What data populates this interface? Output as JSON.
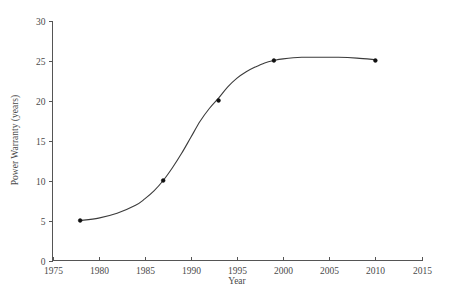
{
  "chart_data": {
    "type": "line",
    "title": "",
    "xlabel": "Year",
    "ylabel": "Power Warranty (years)",
    "xlim": [
      1975,
      2015
    ],
    "ylim": [
      0,
      30
    ],
    "xticks": [
      1975,
      1980,
      1985,
      1990,
      1995,
      2000,
      2005,
      2010,
      2015
    ],
    "xtick_labels": [
      "1975",
      "1980",
      "1985",
      "1990",
      "1995",
      "2000",
      "2005",
      "2010",
      "2015"
    ],
    "yticks": [
      0,
      5,
      10,
      15,
      20,
      25,
      30
    ],
    "ytick_labels": [
      "0",
      "5",
      "10",
      "15",
      "20",
      "25",
      "30"
    ],
    "grid": false,
    "legend": false,
    "marker": "dot",
    "line_color": "#3b3b3b",
    "marker_color": "#111111",
    "axis_color": "#555555",
    "background": "#ffffff",
    "series": [
      {
        "name": "Power Warranty",
        "x": [
          1978,
          1987,
          1993,
          1999,
          2010
        ],
        "values": [
          5,
          10,
          20,
          25,
          25
        ]
      }
    ],
    "fit_curve": {
      "shape": "sigmoid",
      "description": "smooth S-curve rising from about 5 years in 1978 to a plateau near 25 years after 2000",
      "points": [
        [
          1978,
          5.0
        ],
        [
          1980,
          5.3
        ],
        [
          1982,
          5.9
        ],
        [
          1984,
          6.9
        ],
        [
          1985,
          7.7
        ],
        [
          1986,
          8.7
        ],
        [
          1987,
          10.0
        ],
        [
          1988,
          11.6
        ],
        [
          1989,
          13.4
        ],
        [
          1990,
          15.4
        ],
        [
          1991,
          17.4
        ],
        [
          1992,
          19.0
        ],
        [
          1993,
          20.3
        ],
        [
          1994,
          21.7
        ],
        [
          1995,
          22.8
        ],
        [
          1996,
          23.6
        ],
        [
          1997,
          24.2
        ],
        [
          1998,
          24.7
        ],
        [
          1999,
          25.0
        ],
        [
          2000,
          25.2
        ],
        [
          2002,
          25.4
        ],
        [
          2004,
          25.4
        ],
        [
          2006,
          25.4
        ],
        [
          2008,
          25.3
        ],
        [
          2010,
          25.1
        ]
      ]
    }
  },
  "axes": {
    "x_title": "Year",
    "y_title": "Power Warranty (years)"
  }
}
